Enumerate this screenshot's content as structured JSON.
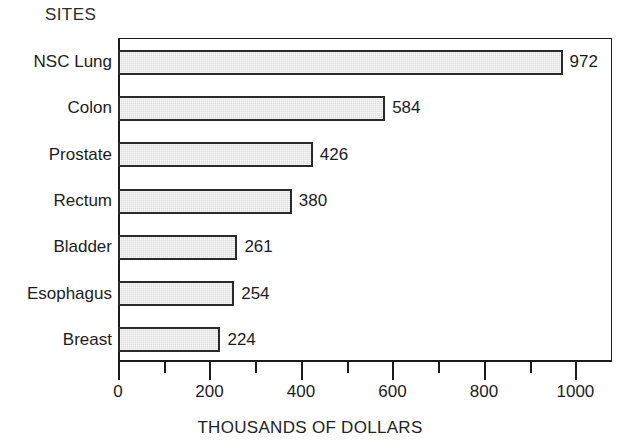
{
  "chart_data": {
    "type": "bar",
    "orientation": "horizontal",
    "title": "",
    "category_axis_title": "SITES",
    "xlabel": "THOUSANDS OF DOLLARS",
    "ylabel": "SITES",
    "categories": [
      "NSC Lung",
      "Colon",
      "Prostate",
      "Rectum",
      "Bladder",
      "Esophagus",
      "Breast"
    ],
    "values": [
      972,
      584,
      426,
      380,
      261,
      254,
      224
    ],
    "value_labels": [
      "972",
      "584",
      "426",
      "380",
      "261",
      "254",
      "224"
    ],
    "xlim": [
      0,
      1080
    ],
    "xticks": [
      0,
      200,
      400,
      600,
      800,
      1000
    ],
    "xtick_labels": [
      "0",
      "200",
      "400",
      "600",
      "800",
      "1000"
    ],
    "minor_xticks": [
      100,
      300,
      500,
      700,
      900
    ],
    "grid": false,
    "legend": null,
    "bar_fill_color": "#dcdcdc",
    "bar_edge_color": "#2a2a2a",
    "axis_color": "#1b1b1b",
    "background_color": "#ffffff"
  }
}
